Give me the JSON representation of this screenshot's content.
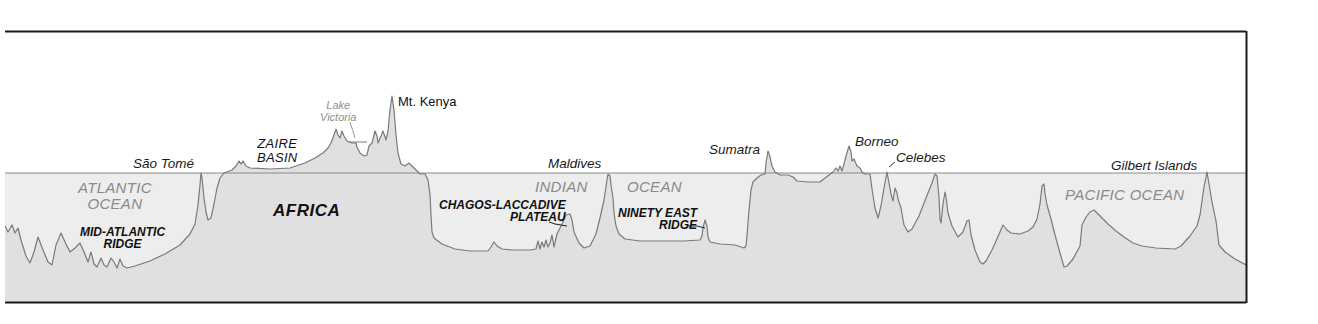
{
  "diagram": {
    "title": "",
    "colors": {
      "frame": "#1a1a1a",
      "profile_line": "#7a7a7a",
      "sea_level_line": "#8a8a8a",
      "water_fill": "#ececec",
      "land_fill": "#e0e0e0",
      "ocean_label": "#8a8a8a",
      "text": "#111111"
    },
    "labels": {
      "sao_tome": "São Tomé",
      "atlantic_ocean_line1": "ATLANTIC",
      "atlantic_ocean_line2": "OCEAN",
      "mid_atlantic_line1": "MID-ATLANTIC",
      "mid_atlantic_line2": "RIDGE",
      "zaire_line1": "ZAIRE",
      "zaire_line2": "BASIN",
      "africa": "AFRICA",
      "lake_line1": "Lake",
      "lake_line2": "Victoria",
      "mt_kenya": "Mt. Kenya",
      "maldives": "Maldives",
      "indian": "INDIAN",
      "ocean": "OCEAN",
      "chagos_line1": "CHAGOS-LACCADIVE",
      "chagos_line2": "PLATEAU",
      "ninety_line1": "NINETY EAST",
      "ninety_line2": "RIDGE",
      "sumatra": "Sumatra",
      "borneo": "Borneo",
      "celebes": "Celebes",
      "pacific_ocean": "PACIFIC OCEAN",
      "gilbert_islands": "Gilbert Islands"
    }
  }
}
